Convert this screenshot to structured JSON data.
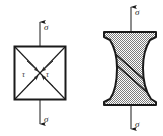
{
  "figure": {
    "background_color": "#ffffff",
    "line_color": "#1a1a1a",
    "fill_pattern_color": "#8c8c8c",
    "panels": [
      {
        "id": "left",
        "name": "stress-element-panel",
        "description": "Square stress element in uniaxial tension with diagonal planes of maximum shear",
        "labels": {
          "sigma_top": "σ",
          "sigma_bottom": "σ",
          "tau_left": "τ",
          "tau_right": "τ"
        },
        "arrows": {
          "top_direction": "up",
          "bottom_direction": "down",
          "shear_arrow_count": 4,
          "shear_arrow_direction": "inward-along-diagonals"
        }
      },
      {
        "id": "right",
        "name": "necked-specimen-panel",
        "description": "Necked tensile specimen with inclined shear fracture band",
        "labels": {
          "sigma_top": "σ",
          "sigma_bottom": "σ"
        },
        "arrows": {
          "top_direction": "up",
          "bottom_direction": "down"
        },
        "shear_band": {
          "lines": 2,
          "orientation": "diagonal-down-right"
        }
      }
    ]
  }
}
